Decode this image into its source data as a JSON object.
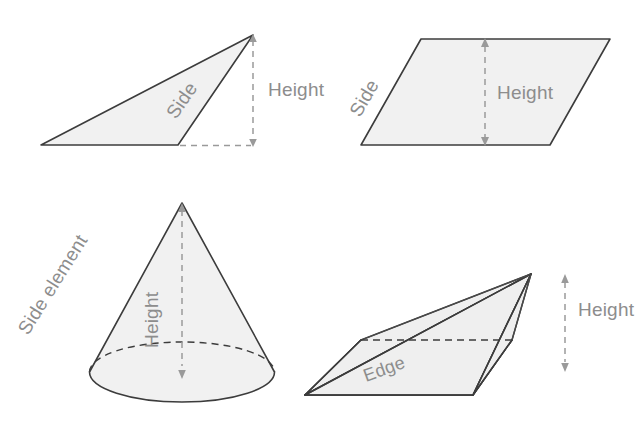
{
  "figure": {
    "width": 642,
    "height": 424,
    "background_color": "#ffffff",
    "shape_fill_color": "#f1f1f1",
    "outline_color": "#3c3c3c",
    "annotation_color": "#8d8d8d",
    "dash_color": "#9a9a9a"
  },
  "panels": [
    {
      "id": "triangle",
      "name": "Triangle",
      "labels": {
        "side": "Side",
        "height": "Height"
      }
    },
    {
      "id": "parallelogram",
      "name": "Parallelogram",
      "labels": {
        "side": "Side",
        "height": "Height"
      }
    },
    {
      "id": "cone",
      "name": "Cone",
      "labels": {
        "side_element": "Side element",
        "height": "Height"
      }
    },
    {
      "id": "prism",
      "name": "Triangular prism",
      "labels": {
        "edge": "Edge",
        "height": "Height"
      }
    }
  ]
}
